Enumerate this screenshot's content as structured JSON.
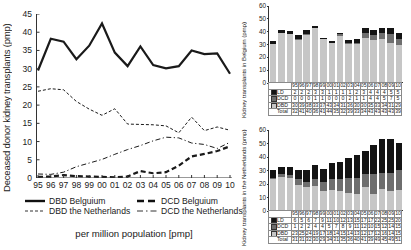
{
  "main": {
    "ylabel": "Deceased donor kidney transplants  (pmp)",
    "caption": "per million population  [pmp]",
    "yticks": [
      "45",
      "40",
      "35",
      "30",
      "25",
      "20",
      "15",
      "10",
      "5",
      "0"
    ],
    "xticks": [
      "95",
      "96",
      "97",
      "98",
      "99",
      "00",
      "01",
      "02",
      "03",
      "04",
      "05",
      "06",
      "07",
      "08",
      "09",
      "10"
    ],
    "legend": [
      {
        "label": "DBD Belguium",
        "style": "solid-thick"
      },
      {
        "label": "DCD Belguium",
        "style": "dashed-thick"
      },
      {
        "label": "DBD the Netherlands",
        "style": "dashed-thin"
      },
      {
        "label": "DCD the Netherlands",
        "style": "dashdot-thin"
      }
    ]
  },
  "belgium_panel": {
    "ylabel": "Kidney transplants in Belgium  (pmp)",
    "yticks": [
      "60",
      "50",
      "40",
      "30",
      "20",
      "10",
      "0"
    ],
    "row_labels": [
      "LD",
      "DCD",
      "DBD",
      "Total"
    ]
  },
  "netherlands_panel": {
    "ylabel": "Kidney transplants in the Netherlands  (pmp)",
    "yticks": [
      "60",
      "50",
      "40",
      "30",
      "20",
      "10",
      "0"
    ],
    "row_labels": [
      "LD",
      "DCD",
      "DBD",
      "Total"
    ]
  },
  "chart_data": [
    {
      "type": "line",
      "id": "deceased-donor-kidney-transplants",
      "title": "",
      "xlabel": "",
      "ylabel": "Deceased donor kidney transplants  (pmp)",
      "caption": "per million population  [pmp]",
      "x": [
        "95",
        "96",
        "97",
        "98",
        "99",
        "00",
        "01",
        "02",
        "03",
        "04",
        "05",
        "06",
        "07",
        "08",
        "09",
        "10"
      ],
      "ylim": [
        0,
        45
      ],
      "ytick_step": 5,
      "grid": false,
      "legend_position": "bottom",
      "series": [
        {
          "name": "DBD Belguium",
          "style": "solid-thick",
          "values": [
            29.5,
            38.2,
            37.4,
            32.6,
            36.3,
            42.4,
            34.4,
            30.7,
            36.1,
            31.0,
            30.1,
            30.7,
            35.0,
            34.0,
            34.2,
            28.6
          ]
        },
        {
          "name": "DBD the Netherlands",
          "style": "dashed-thin",
          "values": [
            23.8,
            24.5,
            24.2,
            21.0,
            18.9,
            17.2,
            19.0,
            14.8,
            14.7,
            14.6,
            14.3,
            12.4,
            16.7,
            13.0,
            14.0,
            13.1
          ]
        },
        {
          "name": "DCD Belguium",
          "style": "dashed-thick",
          "values": [
            0.3,
            0.4,
            0.8,
            0.5,
            0.4,
            0.3,
            0.2,
            0.4,
            1.9,
            1.3,
            1.6,
            3.4,
            5.9,
            6.6,
            7.4,
            8.7
          ]
        },
        {
          "name": "DCD the Netherlands",
          "style": "dashdot-thin",
          "values": [
            1.1,
            1.0,
            1.6,
            3.1,
            4.1,
            5.1,
            6.5,
            7.8,
            8.9,
            10.2,
            11.2,
            11.0,
            9.6,
            9.2,
            8.1,
            9.8
          ]
        }
      ]
    },
    {
      "type": "bar",
      "id": "kidney-transplants-belgium",
      "stacked": true,
      "ylabel": "Kidney transplants in Belgium  (pmp)",
      "ylim": [
        0,
        60
      ],
      "ytick_step": 10,
      "categories": [
        "95",
        "96",
        "97",
        "98",
        "99",
        "00",
        "01",
        "02",
        "03",
        "04",
        "05",
        "06",
        "07",
        "08",
        "09",
        "10"
      ],
      "series": [
        {
          "name": "DBD",
          "values": [
            30,
            39,
            38,
            33,
            37,
            43,
            34,
            31,
            36,
            30,
            30,
            35,
            33,
            34,
            31,
            29
          ]
        },
        {
          "name": "DCD",
          "values": [
            0,
            0,
            0,
            1,
            1,
            0,
            0,
            0,
            2,
            1,
            1,
            4,
            4,
            5,
            7,
            5
          ]
        },
        {
          "name": "LD",
          "values": [
            2,
            2,
            2,
            3,
            3,
            1,
            1,
            1,
            1,
            2,
            3,
            4,
            4,
            4,
            5,
            5
          ]
        },
        {
          "name": "Total",
          "values": [
            32,
            41,
            40,
            36,
            41,
            44,
            35,
            32,
            39,
            33,
            34,
            43,
            43,
            43,
            43,
            39
          ]
        }
      ]
    },
    {
      "type": "bar",
      "id": "kidney-transplants-netherlands",
      "stacked": true,
      "ylabel": "Kidney transplants in the Netherlands  (pmp)",
      "ylim": [
        0,
        60
      ],
      "ytick_step": 10,
      "categories": [
        "95",
        "96",
        "97",
        "98",
        "99",
        "00",
        "01",
        "02",
        "03",
        "04",
        "05",
        "06",
        "07",
        "08",
        "09",
        "10"
      ],
      "series": [
        {
          "name": "DBD",
          "values": [
            23,
            25,
            24,
            19,
            17,
            18,
            14,
            15,
            14,
            13,
            12,
            17,
            12,
            16,
            14,
            15
          ]
        },
        {
          "name": "DCD",
          "values": [
            1,
            2,
            2,
            4,
            4,
            5,
            7,
            8,
            9,
            11,
            12,
            10,
            15,
            12,
            14,
            15
          ]
        },
        {
          "name": "LD",
          "values": [
            6,
            5,
            6,
            7,
            9,
            11,
            10,
            12,
            13,
            15,
            17,
            17,
            22,
            25,
            25,
            20
          ]
        },
        {
          "name": "Total",
          "values": [
            31,
            31,
            32,
            30,
            29,
            34,
            31,
            35,
            36,
            40,
            41,
            39,
            49,
            45,
            49,
            51
          ]
        }
      ]
    }
  ]
}
